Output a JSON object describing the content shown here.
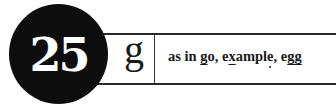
{
  "lesson": {
    "number": "25",
    "letter": "g",
    "example": {
      "prefix": "as in ",
      "words": [
        {
          "parts": [
            {
              "text": "g",
              "mark": "underline"
            },
            {
              "text": "o",
              "mark": "none"
            }
          ],
          "sep": ", "
        },
        {
          "parts": [
            {
              "text": "e",
              "mark": "none"
            },
            {
              "text": "x",
              "mark": "underline"
            },
            {
              "text": "ampl",
              "mark": "none"
            },
            {
              "text": "e",
              "mark": "dot-below"
            }
          ],
          "sep": ", "
        },
        {
          "parts": [
            {
              "text": "e",
              "mark": "none"
            },
            {
              "text": "gg",
              "mark": "underline"
            }
          ],
          "sep": ""
        }
      ]
    }
  },
  "colors": {
    "circle": "#0d0d0d",
    "number": "#ffffff",
    "lines": "#2a2a2a",
    "text": "#1a1a1a"
  }
}
